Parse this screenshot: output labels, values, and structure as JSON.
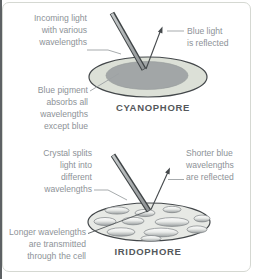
{
  "figure": {
    "title_hint": "Chromatophore light reflection diagram",
    "colors": {
      "label_text": "#8d9297",
      "caption_text": "#54585b",
      "ray_line": "#45494c",
      "leader_line": "#9da2a4",
      "cyanophore_cell_fill": "#dce0d7",
      "pigment_fill": "#a2a6a7",
      "iridophore_cell_fill": "#e7e9e5",
      "platelet_top": "#fdfdfd",
      "platelet_bottom": "#9ba0a1",
      "card_border": "#d5d8d2"
    }
  },
  "cyanophore": {
    "caption": "CYANOPHORE",
    "label_incoming": "Incoming light\nwith various\nwavelengths",
    "label_reflected": "Blue light\nis reflected",
    "label_pigment": "Blue pigment\nabsorbs all\nwavelengths\nexcept blue"
  },
  "iridophore": {
    "caption": "IRIDOPHORE",
    "label_crystal": "Crystal splits\nlight into\ndifferent\nwavelengths",
    "label_reflected": "Shorter blue\nwavelengths\nare reflected",
    "label_transmitted": "Longer wavelengths\nare transmitted\nthrough the cell"
  }
}
